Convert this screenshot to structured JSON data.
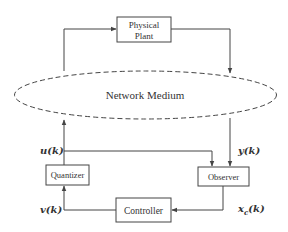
{
  "diagram": {
    "type": "networked control system block diagram",
    "colors": {
      "stroke": "#444444",
      "text": "#333333",
      "background": "#ffffff"
    },
    "blocks": {
      "plant": {
        "line1": "Physical",
        "line2": "Plant"
      },
      "network": {
        "label": "Network Medium",
        "style": "dashed ellipse"
      },
      "quantizer": {
        "label": "Quantizer"
      },
      "observer": {
        "label": "Observer"
      },
      "controller": {
        "label": "Controller"
      }
    },
    "signals": {
      "u": "u(k)",
      "y": "y(k)",
      "v": "v(k)",
      "xc_base": "x",
      "xc_sub": "c",
      "xc_arg": "(k)"
    },
    "edges": [
      {
        "from": "network",
        "to": "plant"
      },
      {
        "from": "plant",
        "to": "network"
      },
      {
        "from": "network",
        "to": "observer",
        "label": "y(k)"
      },
      {
        "from": "quantizer",
        "to": "network",
        "label": "u(k)"
      },
      {
        "from": "quantizer",
        "to": "observer",
        "label": "u(k)"
      },
      {
        "from": "observer",
        "to": "controller",
        "label": "x_c(k)"
      },
      {
        "from": "controller",
        "to": "quantizer",
        "label": "v(k)"
      }
    ]
  }
}
